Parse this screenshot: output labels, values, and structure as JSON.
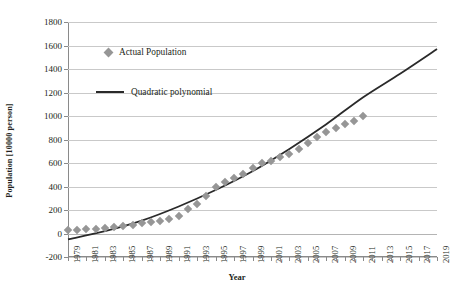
{
  "chart_data": {
    "type": "scatter",
    "title": "",
    "xlabel": "Year",
    "ylabel": "Population [10000 person]",
    "xlim": [
      1979,
      2019
    ],
    "ylim": [
      -200,
      1800
    ],
    "ytick_step": 200,
    "grid": true,
    "legend_position": "inside-upper-left",
    "x_tick_labels": [
      "1979",
      "1981",
      "1983",
      "1985",
      "1987",
      "1989",
      "1991",
      "1993",
      "1995",
      "1997",
      "1999",
      "2001",
      "2003",
      "2005",
      "2007",
      "2009",
      "2011",
      "2013",
      "2015",
      "2017",
      "2019"
    ],
    "y_tick_labels": [
      "1800",
      "1600",
      "1400",
      "1200",
      "1000",
      "800",
      "600",
      "400",
      "200",
      "0",
      "-200"
    ],
    "series": [
      {
        "name": "Actual Population",
        "type": "scatter",
        "marker": "diamond",
        "color": "#969696",
        "x": [
          1979,
          1980,
          1981,
          1982,
          1983,
          1984,
          1985,
          1986,
          1987,
          1988,
          1989,
          1990,
          1991,
          1992,
          1993,
          1994,
          1995,
          1996,
          1997,
          1998,
          1999,
          2000,
          2001,
          2002,
          2003,
          2004,
          2005,
          2006,
          2007,
          2008,
          2009,
          2010,
          2011
        ],
        "values": [
          30,
          32,
          35,
          40,
          48,
          55,
          62,
          75,
          90,
          100,
          110,
          125,
          150,
          210,
          250,
          320,
          400,
          440,
          470,
          510,
          560,
          600,
          620,
          650,
          680,
          720,
          770,
          820,
          860,
          900,
          930,
          960,
          1000
        ]
      },
      {
        "name": "Quadratic polynomial",
        "type": "line",
        "color": "#2a2a2a",
        "x": [
          1979,
          1983,
          1987,
          1991,
          1995,
          1999,
          2003,
          2007,
          2011,
          2015,
          2019
        ],
        "values": [
          -50,
          20,
          110,
          230,
          370,
          530,
          720,
          930,
          1160,
          1360,
          1570
        ]
      }
    ]
  },
  "legend": {
    "items": [
      {
        "label": "Actual Population",
        "marker": "diamond",
        "color": "#969696"
      },
      {
        "label": "Quadratic polynomial",
        "marker": "line",
        "color": "#2a2a2a"
      }
    ]
  },
  "axes": {
    "x_title": "Year",
    "y_title": "Population [10000 person]"
  }
}
